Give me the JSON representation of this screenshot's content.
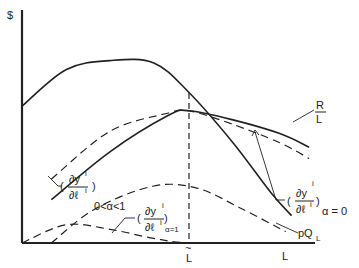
{
  "chart_data": {
    "type": "line",
    "title": "",
    "xlabel": "L",
    "ylabel": "$",
    "x_ticks": [
      "~L"
    ],
    "grid": false,
    "legend": "none (curves labelled directly)",
    "xlim": [
      0,
      1
    ],
    "ylim": [
      0,
      1
    ],
    "series": [
      {
        "name": "pQ_L",
        "style": "solid",
        "x": [
          0.0,
          0.15,
          0.3,
          0.45,
          0.57,
          0.72,
          0.85,
          0.92
        ],
        "y": [
          0.6,
          0.76,
          0.8,
          0.79,
          0.66,
          0.44,
          0.22,
          0.12
        ]
      },
      {
        "name": "R/L",
        "style": "solid",
        "x": [
          0.1,
          0.3,
          0.5,
          0.57,
          0.72,
          0.88,
          0.98
        ],
        "y": [
          0.19,
          0.4,
          0.56,
          0.58,
          0.54,
          0.48,
          0.42
        ]
      },
      {
        "name": "(∂y^i/∂ℓ^i)_{α=0}",
        "style": "dashed",
        "x": [
          0.1,
          0.3,
          0.5,
          0.57,
          0.72,
          0.88,
          0.98
        ],
        "y": [
          0.28,
          0.49,
          0.57,
          0.58,
          0.52,
          0.44,
          0.37
        ]
      },
      {
        "name": "(∂y^i/∂ℓ^i)_{0<α<1}",
        "style": "dashed",
        "x": [
          0.1,
          0.25,
          0.45,
          0.6,
          0.75,
          0.9
        ],
        "y": [
          0.0,
          0.15,
          0.25,
          0.24,
          0.15,
          0.05
        ]
      },
      {
        "name": "(∂y^i/∂ℓ^i)_{α=1}",
        "style": "dashed",
        "x": [
          0.0,
          0.15,
          0.3,
          0.45,
          0.57,
          0.8
        ],
        "y": [
          0.0,
          0.08,
          0.06,
          0.02,
          0.0,
          0.0
        ]
      }
    ],
    "annotations": [
      {
        "text": "~L",
        "meaning": "vertical dashed line where R/L, α=0 curve and pQ_L meet (x≈0.57)"
      }
    ]
  },
  "labels": {
    "y_axis": "$",
    "x_axis": "L",
    "l_tilde": "L",
    "tilde": "~",
    "rl_num": "R",
    "rl_den": "L",
    "pql_main": "pQ",
    "pql_sub": "L",
    "deriv_num": "∂y",
    "deriv_den": "∂ℓ",
    "sup_i": "i",
    "paren_open": "(",
    "paren_close": ")",
    "alpha0": "α = 0",
    "alpha_mid": "0<α<1",
    "alpha1": "α=1"
  }
}
